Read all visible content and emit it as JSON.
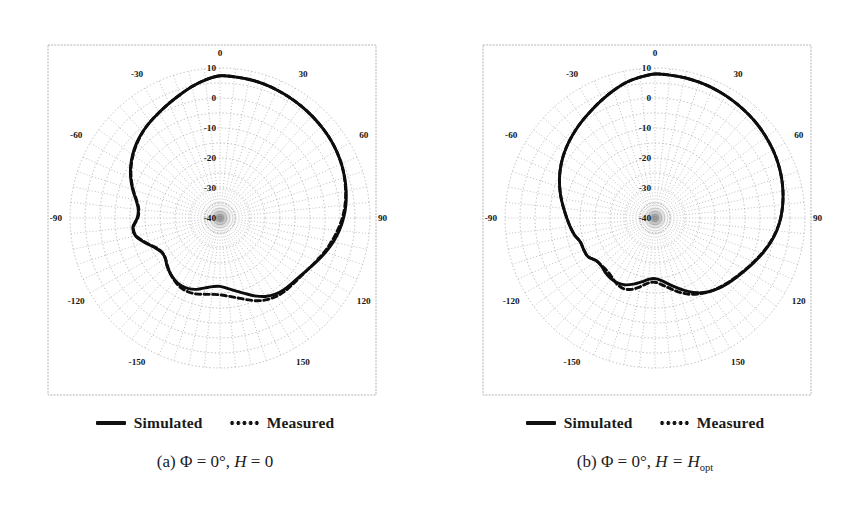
{
  "figure": {
    "kind": "antenna-radiation-pattern-pair",
    "panels": [
      {
        "id": "a",
        "caption_prefix": "(a)",
        "caption_phi": "Φ = 0°,",
        "caption_h_var": "H",
        "caption_h_eq": "= 0",
        "caption_h_sub": "",
        "legend": {
          "simulated": "Simulated",
          "measured": "Measured"
        }
      },
      {
        "id": "b",
        "caption_prefix": "(b)",
        "caption_phi": "Φ = 0°,",
        "caption_h_var": "H",
        "caption_h_eq": "= H",
        "caption_h_sub": "opt",
        "legend": {
          "simulated": "Simulated",
          "measured": "Measured"
        }
      }
    ]
  },
  "chart_data": [
    {
      "type": "line",
      "subtype": "polar-radiation-pattern",
      "title": "(a) Φ = 0°, H = 0",
      "xlabel": "Theta (degrees)",
      "ylabel": "Gain (dB)",
      "grid": true,
      "legend_position": "below",
      "angle_unit": "degrees",
      "angle_zero_at": "top",
      "angle_ticks": [
        0,
        30,
        60,
        90,
        120,
        150,
        180,
        -150,
        -120,
        -90,
        -60,
        -30
      ],
      "angle_tick_labels": [
        "0",
        "30",
        "60",
        "90",
        "120",
        "150",
        "",
        "-150",
        "-120",
        "-90",
        "-60",
        "-30"
      ],
      "angle_minor_step": 6,
      "radial_ticks": [
        10,
        0,
        -10,
        -20,
        -30,
        -40
      ],
      "radial_tick_labels": [
        "10",
        "0",
        "-10",
        "-20",
        "-30",
        "-40"
      ],
      "radial_minor_step": 5,
      "rlim": [
        -40,
        10
      ],
      "series": [
        {
          "name": "Simulated",
          "style": "solid",
          "angles": [
            0,
            6,
            12,
            18,
            24,
            30,
            36,
            42,
            48,
            54,
            60,
            66,
            72,
            78,
            84,
            90,
            96,
            102,
            108,
            114,
            120,
            126,
            132,
            138,
            144,
            150,
            156,
            162,
            168,
            174,
            180,
            -174,
            -168,
            -162,
            -156,
            -150,
            -144,
            -138,
            -132,
            -126,
            -120,
            -114,
            -108,
            -102,
            -96,
            -90,
            -84,
            -78,
            -72,
            -66,
            -60,
            -54,
            -48,
            -42,
            -36,
            -30,
            -24,
            -18,
            -12,
            -6
          ],
          "values": [
            7.4,
            7.3,
            7.2,
            7.0,
            6.7,
            6.4,
            6.1,
            5.8,
            5.5,
            5.2,
            4.8,
            4.3,
            3.7,
            3.0,
            2.2,
            1.2,
            0.0,
            -1.4,
            -3.0,
            -4.6,
            -6.0,
            -7.0,
            -7.6,
            -8.0,
            -8.6,
            -9.8,
            -11.6,
            -13.6,
            -15.2,
            -16.4,
            -17.2,
            -17.0,
            -16.2,
            -15.0,
            -14.2,
            -14.0,
            -14.4,
            -15.2,
            -16.2,
            -17.4,
            -17.4,
            -16.0,
            -13.6,
            -11.2,
            -10.8,
            -12.4,
            -12.6,
            -11.4,
            -9.4,
            -7.4,
            -5.6,
            -4.0,
            -2.6,
            -1.4,
            -0.4,
            0.6,
            1.8,
            3.2,
            4.8,
            6.3
          ]
        },
        {
          "name": "Measured",
          "style": "dotted",
          "angles": [
            0,
            6,
            12,
            18,
            24,
            30,
            36,
            42,
            48,
            54,
            60,
            66,
            72,
            78,
            84,
            90,
            96,
            102,
            108,
            114,
            120,
            126,
            132,
            138,
            144,
            150,
            156,
            162,
            168,
            174,
            180,
            -174,
            -168,
            -162,
            -156,
            -150,
            -144,
            -138,
            -132,
            -126,
            -120,
            -114,
            -108,
            -102,
            -96,
            -90,
            -84,
            -78,
            -72,
            -66,
            -60,
            -54,
            -48,
            -42,
            -36,
            -30,
            -24,
            -18,
            -12,
            -6
          ],
          "values": [
            7.4,
            7.3,
            7.2,
            7.0,
            6.7,
            6.4,
            6.1,
            5.8,
            5.5,
            5.2,
            4.8,
            4.3,
            3.6,
            2.8,
            1.9,
            0.8,
            -0.6,
            -2.0,
            -3.4,
            -4.8,
            -6.0,
            -6.8,
            -7.2,
            -7.4,
            -7.8,
            -8.6,
            -9.8,
            -11.4,
            -12.8,
            -13.8,
            -14.4,
            -14.4,
            -14.0,
            -13.4,
            -13.2,
            -13.4,
            -14.2,
            -15.2,
            -16.4,
            -17.4,
            -17.5,
            -16.2,
            -13.8,
            -11.4,
            -11.0,
            -12.6,
            -12.8,
            -11.6,
            -9.6,
            -7.6,
            -5.8,
            -4.2,
            -2.8,
            -1.5,
            -0.4,
            0.6,
            1.8,
            3.2,
            4.8,
            6.3
          ]
        }
      ]
    },
    {
      "type": "line",
      "subtype": "polar-radiation-pattern",
      "title": "(b) Φ = 0°, H = Hopt",
      "xlabel": "Theta (degrees)",
      "ylabel": "Gain (dB)",
      "grid": true,
      "legend_position": "below",
      "angle_unit": "degrees",
      "angle_zero_at": "top",
      "angle_ticks": [
        0,
        30,
        60,
        90,
        120,
        150,
        180,
        -150,
        -120,
        -90,
        -60,
        -30
      ],
      "angle_tick_labels": [
        "0",
        "30",
        "60",
        "90",
        "120",
        "150",
        "",
        "-150",
        "-120",
        "-90",
        "-60",
        "-30"
      ],
      "angle_minor_step": 6,
      "radial_ticks": [
        10,
        0,
        -10,
        -20,
        -30,
        -40
      ],
      "radial_tick_labels": [
        "10",
        "0",
        "-10",
        "-20",
        "-30",
        "-40"
      ],
      "radial_minor_step": 5,
      "rlim": [
        -40,
        10
      ],
      "series": [
        {
          "name": "Simulated",
          "style": "solid",
          "angles": [
            0,
            6,
            12,
            18,
            24,
            30,
            36,
            42,
            48,
            54,
            60,
            66,
            72,
            78,
            84,
            90,
            96,
            102,
            108,
            114,
            120,
            126,
            132,
            138,
            144,
            150,
            156,
            162,
            168,
            174,
            180,
            -174,
            -168,
            -162,
            -156,
            -150,
            -144,
            -138,
            -132,
            -126,
            -120,
            -114,
            -108,
            -102,
            -96,
            -90,
            -84,
            -78,
            -72,
            -66,
            -60,
            -54,
            -48,
            -42,
            -36,
            -30,
            -24,
            -18,
            -12,
            -6
          ],
          "values": [
            8.0,
            7.9,
            7.8,
            7.6,
            7.4,
            7.1,
            6.8,
            6.5,
            6.2,
            5.8,
            5.4,
            4.9,
            4.3,
            3.6,
            2.8,
            1.9,
            0.8,
            -0.6,
            -2.2,
            -3.8,
            -5.2,
            -6.4,
            -7.4,
            -8.4,
            -9.6,
            -11.2,
            -13.2,
            -15.4,
            -17.4,
            -19.0,
            -19.8,
            -19.4,
            -18.2,
            -16.8,
            -15.6,
            -15.0,
            -15.0,
            -15.4,
            -16.0,
            -15.8,
            -14.2,
            -14.0,
            -13.9,
            -12.6,
            -11.6,
            -10.6,
            -9.4,
            -8.0,
            -6.6,
            -5.2,
            -3.9,
            -2.7,
            -1.6,
            -0.5,
            0.6,
            1.8,
            3.2,
            4.7,
            6.2,
            7.2
          ]
        },
        {
          "name": "Measured",
          "style": "dotted",
          "angles": [
            0,
            6,
            12,
            18,
            24,
            30,
            36,
            42,
            48,
            54,
            60,
            66,
            72,
            78,
            84,
            90,
            96,
            102,
            108,
            114,
            120,
            126,
            132,
            138,
            144,
            150,
            156,
            162,
            168,
            174,
            180,
            -174,
            -168,
            -162,
            -156,
            -150,
            -144,
            -138,
            -132,
            -126,
            -120,
            -114,
            -108,
            -102,
            -96,
            -90,
            -84,
            -78,
            -72,
            -66,
            -60,
            -54,
            -48,
            -42,
            -36,
            -30,
            -24,
            -18,
            -12,
            -6
          ],
          "values": [
            8.0,
            7.9,
            7.8,
            7.6,
            7.4,
            7.1,
            6.8,
            6.5,
            6.2,
            5.8,
            5.4,
            4.9,
            4.3,
            3.6,
            2.8,
            1.9,
            0.7,
            -0.8,
            -2.4,
            -4.0,
            -5.4,
            -6.6,
            -7.6,
            -8.6,
            -9.6,
            -10.8,
            -12.2,
            -14.0,
            -16.0,
            -17.6,
            -18.6,
            -18.2,
            -16.6,
            -15.0,
            -14.2,
            -14.6,
            -15.6,
            -16.2,
            -16.2,
            -15.8,
            -14.2,
            -14.0,
            -13.9,
            -12.6,
            -11.6,
            -10.6,
            -9.4,
            -8.0,
            -6.6,
            -5.2,
            -3.9,
            -2.7,
            -1.6,
            -0.5,
            0.6,
            1.8,
            3.2,
            4.7,
            6.2,
            7.2
          ]
        }
      ]
    }
  ]
}
